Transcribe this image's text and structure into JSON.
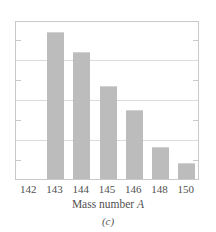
{
  "figure": {
    "caption": "(c)",
    "xaxis_title_text": "Mass number",
    "xaxis_title_variable": "A"
  },
  "colors": {
    "bar_fill": "#bcbcbc",
    "frame": "#c9c9c9",
    "gridline": "#dcdcdc",
    "text": "#4f4f4f"
  },
  "chart_data": {
    "type": "bar",
    "title": "",
    "subtitle": "(c)",
    "xlabel": "Mass number A",
    "ylabel": "",
    "categories": [
      "142",
      "143",
      "144",
      "145",
      "146",
      "148",
      "150"
    ],
    "values": [
      0,
      92.5,
      80.0,
      58.5,
      43.5,
      20.0,
      10.0
    ],
    "ylim": [
      0,
      100
    ],
    "xlim_note": "categorical, 7 evenly spaced slots",
    "gridlines_y": [
      25,
      50,
      75
    ],
    "minor_ticks_y": [
      12.5,
      37.5,
      62.5,
      87.5
    ],
    "grid": true,
    "legend": null,
    "annotations": [],
    "bars": [
      {
        "category": "142",
        "value": 0,
        "height_px": 0
      },
      {
        "category": "143",
        "value": 92.5,
        "height_px": 147
      },
      {
        "category": "144",
        "value": 80.0,
        "height_px": 134
      },
      {
        "category": "145",
        "value": 58.5,
        "height_px": 93
      },
      {
        "category": "146",
        "value": 43.5,
        "height_px": 69
      },
      {
        "category": "148",
        "value": 20.0,
        "height_px": 32
      },
      {
        "category": "150",
        "value": 10.0,
        "height_px": 16
      }
    ]
  }
}
